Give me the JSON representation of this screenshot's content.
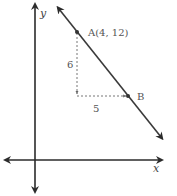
{
  "diagram": {
    "axes": {
      "x_label": "x",
      "y_label": "y"
    },
    "point_a": {
      "label": "A(4, 12)",
      "x": 4,
      "y": 12
    },
    "point_b": {
      "label": "B"
    },
    "rise_label": "6",
    "run_label": "5",
    "colors": {
      "axis": "#2b2b2b",
      "line": "#3a3a3a",
      "dashed": "#666666",
      "text": "#555555"
    }
  }
}
